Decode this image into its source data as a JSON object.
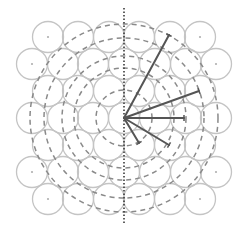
{
  "diagram": {
    "type": "hexagonal circle packing with concentric dashed rings and radial vectors",
    "center": {
      "x": 124,
      "y": 118
    },
    "colors": {
      "background": "#ffffff",
      "packed_circle_stroke": "#c4c4c4",
      "center_dot": "#b0b0b0",
      "dashed_ring": "#8a8a8a",
      "radial_line": "#555555",
      "axis_dotted": "#3a3a3a"
    },
    "packing": {
      "radius": 15.5,
      "row_spacing": 27,
      "col_spacing": 31,
      "rows": [
        {
          "y": 37,
          "xs": [
            48,
            78,
            109,
            139,
            170,
            200
          ],
          "dots": [
            48,
            200
          ]
        },
        {
          "y": 64,
          "xs": [
            32,
            63,
            93,
            124,
            155,
            186,
            216
          ],
          "dots": [
            32,
            216
          ]
        },
        {
          "y": 91,
          "xs": [
            48,
            78,
            109,
            139,
            170,
            200
          ],
          "dots": []
        },
        {
          "y": 118,
          "xs": [
            32,
            63,
            93,
            124,
            155,
            186,
            216
          ],
          "dots": []
        },
        {
          "y": 145,
          "xs": [
            48,
            78,
            109,
            139,
            170,
            200
          ],
          "dots": []
        },
        {
          "y": 172,
          "xs": [
            32,
            63,
            93,
            124,
            155,
            186,
            216
          ],
          "dots": [
            32,
            216
          ]
        },
        {
          "y": 199,
          "xs": [
            48,
            78,
            109,
            139,
            170,
            200
          ],
          "dots": [
            48,
            200
          ]
        }
      ]
    },
    "dashed_rings": [
      28,
      50,
      62,
      80,
      94
    ],
    "vertical_axis": {
      "x": 124,
      "y1": 8,
      "y2": 224
    },
    "radial_lines": [
      {
        "x2": 169,
        "y2": 35
      },
      {
        "x2": 199,
        "y2": 91
      },
      {
        "x2": 184,
        "y2": 118
      },
      {
        "x2": 169,
        "y2": 145
      },
      {
        "x2": 139,
        "y2": 143
      }
    ]
  }
}
